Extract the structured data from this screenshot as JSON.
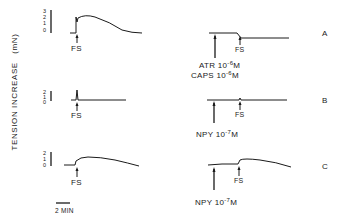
{
  "figure": {
    "y_axis_label": "TENSION INCREASE",
    "y_axis_unit": "(mN)",
    "time_scale_label": "2 MIN",
    "stimulus_label": "FS",
    "panels": [
      {
        "id": "A",
        "scale_ticks": [
          "3",
          "2",
          "1",
          "0"
        ],
        "left_trace": "FS-evoked contraction: rapid rise to ~3 mN then slow decay to baseline",
        "right_drug_lines": [
          {
            "name": "ATR",
            "conc_base": "10",
            "conc_exp": "-6",
            "unit": "M"
          },
          {
            "name": "CAPS",
            "conc_base": "10",
            "conc_exp": "-6",
            "unit": "M"
          }
        ],
        "right_trace": "after ATR + CAPS pretreatment, FS produces small relaxation (drop below baseline)"
      },
      {
        "id": "B",
        "scale_ticks": [
          "2",
          "1",
          "0"
        ],
        "left_trace": "FS evokes brief transient spike then return to baseline",
        "right_drug_lines": [
          {
            "name": "NPY",
            "conc_base": "10",
            "conc_exp": "-7",
            "unit": "M"
          }
        ],
        "right_trace": "after NPY, FS response nearly abolished"
      },
      {
        "id": "C",
        "scale_ticks": [
          "2",
          "1",
          "0"
        ],
        "left_trace": "FS evokes sustained contraction ~1 mN with slow decline",
        "right_drug_lines": [
          {
            "name": "NPY",
            "conc_base": "10",
            "conc_exp": "-7",
            "unit": "M"
          }
        ],
        "right_trace": "after NPY, FS still evokes sustained contraction ~1 mN"
      }
    ]
  }
}
